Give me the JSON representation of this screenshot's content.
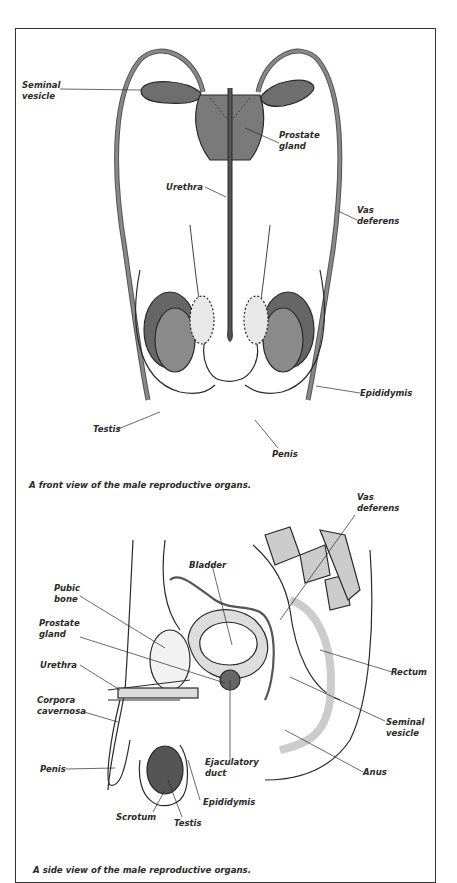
{
  "front_view": {
    "caption": "A front view of the male reproductive organs.",
    "labels": {
      "seminal_vesicle": "Seminal\nvesicle",
      "prostate_gland": "Prostate\ngland",
      "urethra": "Urethra",
      "vas_deferens": "Vas\ndeferens",
      "epididymis": "Epididymis",
      "testis": "Testis",
      "penis": "Penis"
    }
  },
  "side_view": {
    "caption": "A side view of the male reproductive organs.",
    "labels": {
      "vas_deferens": "Vas\ndeferens",
      "bladder": "Bladder",
      "pubic_bone": "Pubic\nbone",
      "prostate_gland": "Prostate\ngland",
      "urethra": "Urethra",
      "rectum": "Rectum",
      "corpora_cavernosa": "Corpora\ncavernosa",
      "seminal_vesicle": "Seminal\nvesicle",
      "ejaculatory_duct": "Ejaculatory\nduct",
      "penis": "Penis",
      "anus": "Anus",
      "epididymis": "Epididymis",
      "scrotum": "Scrotum",
      "testis": "Testis"
    }
  },
  "colors": {
    "organ_fill": "#6e6e6e",
    "line": "#2a2a2a",
    "tissue": "#d9d9d9"
  }
}
